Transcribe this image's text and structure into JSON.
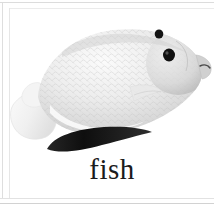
{
  "card": {
    "caption": "fish",
    "background_color": "#ffffff",
    "border_color": "#dcdcdc",
    "caption_color": "#1b1b1b"
  },
  "illustration": {
    "subject": "fish",
    "alt_label": "fish",
    "style": "grayscale photograph",
    "body_fill_light": "#f2f2f2",
    "body_fill_mid": "#d8d8d8",
    "body_fill_dark": "#b9b9b9",
    "fin_fill": "#efefef",
    "ventral_fin_fill": "#141414",
    "eye_fill": "#111111",
    "spot_fill": "#151515",
    "parts": [
      {
        "name": "body",
        "label": "body"
      },
      {
        "name": "tail-fin",
        "label": "tail fin"
      },
      {
        "name": "dorsal-fin",
        "label": "dorsal fin"
      },
      {
        "name": "pectoral-fin",
        "label": "pectoral fin"
      },
      {
        "name": "ventral-fin",
        "label": "ventral fin"
      },
      {
        "name": "eye",
        "label": "eye"
      },
      {
        "name": "head-spot",
        "label": "head spot"
      },
      {
        "name": "snout",
        "label": "snout"
      }
    ]
  },
  "frame": {
    "rules": [
      {
        "name": "top-rule"
      },
      {
        "name": "left-outer-rule"
      },
      {
        "name": "left-inner-rule"
      },
      {
        "name": "inner-top-rule"
      },
      {
        "name": "bottom-inner-rule"
      },
      {
        "name": "bottom-outer-rule"
      }
    ]
  }
}
